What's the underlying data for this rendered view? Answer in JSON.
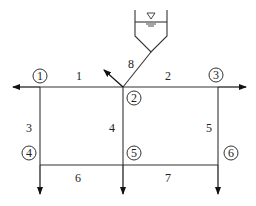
{
  "diagram": {
    "type": "pipe-network",
    "colors": {
      "line": "#333333",
      "text": "#222222",
      "background": "#ffffff"
    },
    "reservoir": {
      "label": "reservoir",
      "water_level_symbol": "▽"
    },
    "nodes": [
      {
        "id": "1",
        "label": "1"
      },
      {
        "id": "2",
        "label": "2"
      },
      {
        "id": "3",
        "label": "3"
      },
      {
        "id": "4",
        "label": "4"
      },
      {
        "id": "5",
        "label": "5"
      },
      {
        "id": "6",
        "label": "6"
      }
    ],
    "pipes": [
      {
        "id": "1",
        "label": "1",
        "from": "1",
        "to": "2"
      },
      {
        "id": "2",
        "label": "2",
        "from": "2",
        "to": "3"
      },
      {
        "id": "3",
        "label": "3",
        "from": "1",
        "to": "4"
      },
      {
        "id": "4",
        "label": "4",
        "from": "2",
        "to": "5"
      },
      {
        "id": "5",
        "label": "5",
        "from": "3",
        "to": "6"
      },
      {
        "id": "6",
        "label": "6",
        "from": "4",
        "to": "5"
      },
      {
        "id": "7",
        "label": "7",
        "from": "5",
        "to": "6"
      },
      {
        "id": "8",
        "label": "8",
        "from": "reservoir",
        "to": "2"
      }
    ],
    "outflows": [
      {
        "at_node": "1",
        "direction": "left"
      },
      {
        "at_node": "2",
        "direction": "up-left"
      },
      {
        "at_node": "3",
        "direction": "right"
      },
      {
        "at_node": "4",
        "direction": "down"
      },
      {
        "at_node": "5",
        "direction": "down"
      },
      {
        "at_node": "6",
        "direction": "down"
      }
    ]
  }
}
